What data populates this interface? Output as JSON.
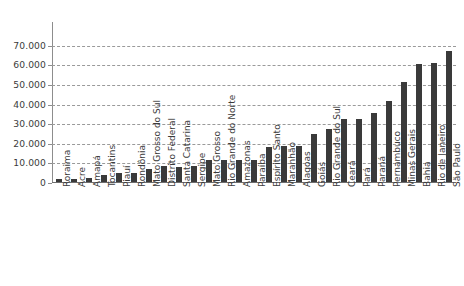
{
  "chart_data": {
    "type": "bar",
    "title": "",
    "subtitle": "",
    "xlabel": "",
    "ylabel": "",
    "ylim": [
      0,
      75000
    ],
    "grid": true,
    "legend": "none",
    "orientation": "vertical",
    "bar_color": "#3a3a3a",
    "gridline_color": "#9a9a9a",
    "axis_color": "#8d8d8d",
    "thousands_separator": ".",
    "y_ticks": [
      0,
      10000,
      20000,
      30000,
      40000,
      50000,
      60000,
      70000
    ],
    "y_tick_labels": [
      "0",
      "10.000",
      "20.000",
      "30.000",
      "40.000",
      "50.000",
      "60.000",
      "70.000"
    ],
    "categories": [
      "Roraima",
      "Acre",
      "Amapá",
      "Tocantins",
      "Piauí",
      "Rondônia",
      "Mato Grosso do Sul",
      "Distrito Federal",
      "Santa Catarina",
      "Sergipe",
      "Mato Grosso",
      "Rio Grande do Norte",
      "Amazonas",
      "Paraíba",
      "Espírito Santo",
      "Maranhão",
      "Alagoas",
      "Goiás",
      "Rio Grande do Sul",
      "Ceará",
      "Pará",
      "Paraná",
      "Pernambuco",
      "Minas Gerais",
      "Bahia",
      "Rio de Janeiro",
      "São Paulo"
    ],
    "values": [
      1800,
      1800,
      2500,
      4000,
      5200,
      5300,
      7000,
      8500,
      8400,
      8500,
      11500,
      11700,
      11700,
      11900,
      18500,
      18800,
      19000,
      25000,
      27500,
      32500,
      32700,
      35500,
      42000,
      51500,
      60500,
      61000,
      67500
    ]
  }
}
